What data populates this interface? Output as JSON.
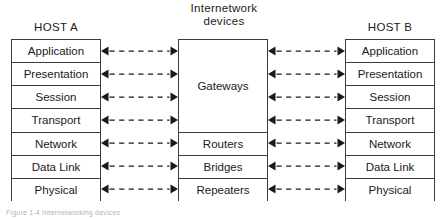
{
  "figure": {
    "caption": "Figure 1-4  Internetworking devices"
  },
  "columns": {
    "host_a": {
      "header": "HOST A",
      "layers": [
        "Application",
        "Presentation",
        "Session",
        "Transport",
        "Network",
        "Data Link",
        "Physical"
      ]
    },
    "host_b": {
      "header": "HOST B",
      "layers": [
        "Application",
        "Presentation",
        "Session",
        "Transport",
        "Network",
        "Data Link",
        "Physical"
      ]
    },
    "center": {
      "header_line1": "Internetwork",
      "header_line2": "devices",
      "devices": [
        {
          "label": "Gateways",
          "spans": 4
        },
        {
          "label": "Routers",
          "spans": 1
        },
        {
          "label": "Bridges",
          "spans": 1
        },
        {
          "label": "Repeaters",
          "spans": 1
        }
      ]
    }
  },
  "connections": {
    "style": "dashed-double-headed-arrow",
    "count_per_side": 7,
    "color": "#1a1a1a"
  },
  "colors": {
    "background": "#ffffff",
    "border": "#3c3c3c",
    "text": "#1a1a1a",
    "caption": "#b4b4b4"
  }
}
